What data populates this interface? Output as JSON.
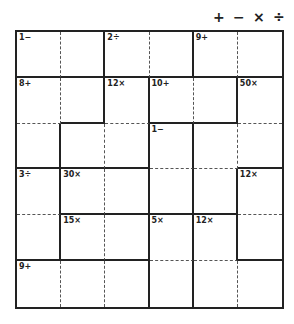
{
  "operators": [
    "+",
    "−",
    "×",
    "÷"
  ],
  "grid": {
    "size": 6
  },
  "cages": [
    {
      "id": "A",
      "clue": "1−",
      "cells": [
        [
          0,
          0
        ],
        [
          0,
          1
        ]
      ]
    },
    {
      "id": "B",
      "clue": "2÷",
      "cells": [
        [
          0,
          2
        ],
        [
          0,
          3
        ]
      ]
    },
    {
      "id": "C",
      "clue": "9+",
      "cells": [
        [
          0,
          4
        ],
        [
          0,
          5
        ]
      ]
    },
    {
      "id": "D",
      "clue": "8+",
      "cells": [
        [
          1,
          0
        ],
        [
          1,
          1
        ],
        [
          2,
          0
        ]
      ]
    },
    {
      "id": "E",
      "clue": "12×",
      "cells": [
        [
          1,
          2
        ],
        [
          2,
          2
        ],
        [
          2,
          1
        ]
      ]
    },
    {
      "id": "F",
      "clue": "10+",
      "cells": [
        [
          1,
          3
        ],
        [
          1,
          4
        ]
      ]
    },
    {
      "id": "G",
      "clue": "50×",
      "cells": [
        [
          1,
          5
        ],
        [
          2,
          5
        ],
        [
          2,
          4
        ],
        [
          3,
          4
        ]
      ]
    },
    {
      "id": "H",
      "clue": "1−",
      "cells": [
        [
          2,
          3
        ],
        [
          3,
          3
        ]
      ]
    },
    {
      "id": "I",
      "clue": "3÷",
      "cells": [
        [
          3,
          0
        ],
        [
          4,
          0
        ]
      ]
    },
    {
      "id": "J",
      "clue": "30×",
      "cells": [
        [
          3,
          1
        ],
        [
          3,
          2
        ]
      ]
    },
    {
      "id": "K",
      "clue": "12×",
      "cells": [
        [
          3,
          5
        ],
        [
          4,
          5
        ]
      ]
    },
    {
      "id": "L",
      "clue": "15×",
      "cells": [
        [
          4,
          1
        ],
        [
          4,
          2
        ]
      ]
    },
    {
      "id": "M",
      "clue": "5×",
      "cells": [
        [
          4,
          3
        ],
        [
          5,
          3
        ]
      ]
    },
    {
      "id": "N",
      "clue": "12×",
      "cells": [
        [
          4,
          4
        ],
        [
          5,
          4
        ],
        [
          5,
          5
        ]
      ]
    },
    {
      "id": "O",
      "clue": "9+",
      "cells": [
        [
          5,
          0
        ],
        [
          5,
          1
        ],
        [
          5,
          2
        ]
      ]
    }
  ],
  "colors": {
    "line": "#222222",
    "dotted": "#555555",
    "background": "#ffffff"
  }
}
